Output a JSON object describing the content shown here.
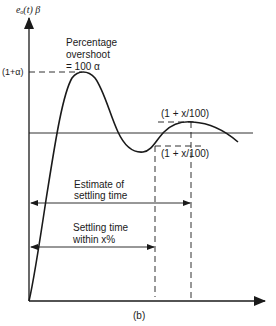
{
  "diagram": {
    "y_axis_label": "eₒ(t) β",
    "peak_label": "(1+α)",
    "overshoot_label": {
      "line1": "Percentage",
      "line2": "overshoot",
      "line3": "= 100  α"
    },
    "upper_band_label": "(1 + x/100)",
    "lower_band_label": "(1 + x/100)",
    "estimate_label": {
      "line1": "Estimate of",
      "line2": "settling time"
    },
    "settling_label": {
      "line1": "Settling time",
      "line2": "within x%"
    },
    "caption": "(b)",
    "colors": {
      "stroke": "#1a1a1a",
      "background": "#ffffff"
    }
  }
}
